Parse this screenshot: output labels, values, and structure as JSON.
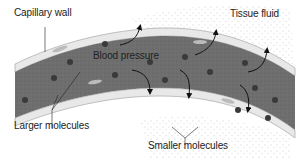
{
  "diagram": {
    "labels": {
      "capillary_wall": "Capillary wall",
      "tissue_fluid": "Tissue fluid",
      "blood_pressure": "Blood pressure",
      "larger_molecules": "Larger molecules",
      "smaller_molecules": "Smaller molecules"
    },
    "colors": {
      "blood": "#6e6e6e",
      "wall": "#e8e8e8",
      "wall_outline": "#9a9a9a",
      "molecule": "#3a3a3a",
      "speckle": "#888888",
      "text": "#222222"
    }
  }
}
